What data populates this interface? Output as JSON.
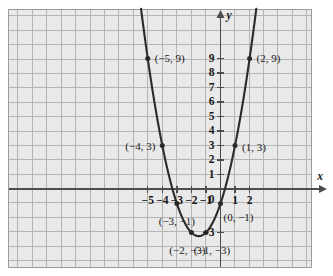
{
  "figure": {
    "kind": "coordinate-plane-graph",
    "background": "#e9e9e9",
    "grid_color": "#b3b3b3",
    "curve_color": "#2b2b2b",
    "axis_color": "#4d4d4d",
    "border_color": "#9b9b9b"
  },
  "axes": {
    "x_axis_label": "x",
    "y_axis_label": "y",
    "x_ticks": [
      {
        "value": -5,
        "label": "−5"
      },
      {
        "value": -4,
        "label": "−4"
      },
      {
        "value": -3,
        "label": "−3"
      },
      {
        "value": -2,
        "label": "−2"
      },
      {
        "value": -1,
        "label": "−1"
      },
      {
        "value": 1,
        "label": "1"
      },
      {
        "value": 2,
        "label": "2"
      }
    ],
    "origin_label": "0",
    "y_ticks": [
      {
        "value": 9,
        "label": "9"
      },
      {
        "value": 8,
        "label": "8"
      },
      {
        "value": 7,
        "label": "7"
      },
      {
        "value": 6,
        "label": "6"
      },
      {
        "value": 5,
        "label": "5"
      },
      {
        "value": 4,
        "label": "4"
      },
      {
        "value": 3,
        "label": "3"
      },
      {
        "value": 2,
        "label": "2"
      },
      {
        "value": 1,
        "label": "1"
      },
      {
        "value": -3,
        "label": "−3"
      }
    ]
  },
  "chart_data": {
    "type": "scatter",
    "title": "",
    "xlabel": "x",
    "ylabel": "y",
    "grid": true,
    "legend": "none",
    "xlim": [
      -5.85,
      2.85
    ],
    "ylim": [
      -4.2,
      10.1
    ],
    "curve": {
      "equation": "y = x^2 + 3x - 1",
      "form": "parabola",
      "vertex": [
        -1.5,
        -3.25
      ],
      "opens": "up"
    },
    "points": [
      {
        "x": -5,
        "y": 9,
        "label": "(−5, 9)",
        "label_pos": "right"
      },
      {
        "x": -4,
        "y": 3,
        "label": "(−4, 3)",
        "label_pos": "left"
      },
      {
        "x": -3,
        "y": -1,
        "label": "(−3, −1)",
        "label_pos": "below-left"
      },
      {
        "x": -2,
        "y": -3,
        "label": "(−2, −3)",
        "label_pos": "below-left"
      },
      {
        "x": -1,
        "y": -3,
        "label": "(−1, −3)",
        "label_pos": "below"
      },
      {
        "x": 0,
        "y": -1,
        "label": "(0, −1)",
        "label_pos": "below-right"
      },
      {
        "x": 1,
        "y": 3,
        "label": "(1, 3)",
        "label_pos": "right"
      },
      {
        "x": 2,
        "y": 9,
        "label": "(2, 9)",
        "label_pos": "right"
      }
    ]
  }
}
